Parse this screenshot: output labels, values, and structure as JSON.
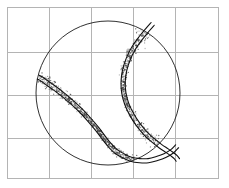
{
  "figure": {
    "title": "",
    "background_color": "#ffffff",
    "width": 229,
    "height": 188
  },
  "chart_data": {
    "type": "scatter",
    "title": "",
    "subtitle": "",
    "xlabel": "",
    "ylabel": "",
    "xlim": [
      -1.35,
      1.35
    ],
    "ylim": [
      -1.1,
      1.1
    ],
    "grid": true,
    "grid_color": "#b4b4b4",
    "axis_ticks_visible": false,
    "tick_labels_x": [],
    "tick_labels_y": [],
    "legend": null,
    "legend_position": "none",
    "annotations": [],
    "frame": {
      "x0": 7,
      "y0": 7,
      "x1": 218,
      "y1": 178,
      "color": "#b4b4b4",
      "line_width": 1
    },
    "gridlines": {
      "vertical_x": [
        49,
        91,
        133,
        175
      ],
      "horizontal_y": [
        52,
        95,
        138
      ],
      "columns": 5,
      "rows": 4
    },
    "series": [
      {
        "name": "sphere-outline",
        "kind": "circle",
        "color": "#1a1a1a",
        "line_width": 0.9,
        "center_px": [
          108,
          93
        ],
        "radius_px": 72,
        "center_data": [
          0.0,
          0.0
        ],
        "radius_data": 1.0
      },
      {
        "name": "seam-curve-outer",
        "kind": "line",
        "color": "#111111",
        "line_width": 1.1,
        "description": "tennis-ball seam, outer strand of the S-shaped double line"
      },
      {
        "name": "seam-curve-inner",
        "kind": "line",
        "color": "#111111",
        "line_width": 1.1,
        "description": "tennis-ball seam, inner strand of the S-shaped double line"
      },
      {
        "name": "sampled-points",
        "kind": "scatter",
        "color": "#3c3c3c",
        "marker": "dot",
        "marker_size": 0.65,
        "point_count": 1400,
        "description": "noisy sampled points clustered along the seam curve, denser at the lower-right loop and the upper-left cusp"
      }
    ],
    "seam_path_points": [
      [
        0.62,
        0.96
      ],
      [
        0.55,
        0.88
      ],
      [
        0.46,
        0.77
      ],
      [
        0.36,
        0.63
      ],
      [
        0.28,
        0.47
      ],
      [
        0.23,
        0.31
      ],
      [
        0.21,
        0.15
      ],
      [
        0.22,
        0.0
      ],
      [
        0.26,
        -0.15
      ],
      [
        0.33,
        -0.3
      ],
      [
        0.42,
        -0.44
      ],
      [
        0.52,
        -0.56
      ],
      [
        0.63,
        -0.66
      ],
      [
        0.73,
        -0.74
      ],
      [
        0.82,
        -0.8
      ],
      [
        0.89,
        -0.85
      ],
      [
        0.94,
        -0.89
      ],
      [
        0.97,
        -0.93
      ]
    ],
    "seam_path_points_left": [
      [
        -0.97,
        0.22
      ],
      [
        -0.93,
        0.2
      ],
      [
        -0.86,
        0.15
      ],
      [
        -0.76,
        0.08
      ],
      [
        -0.64,
        -0.01
      ],
      [
        -0.51,
        -0.12
      ],
      [
        -0.38,
        -0.24
      ],
      [
        -0.26,
        -0.37
      ],
      [
        -0.15,
        -0.5
      ],
      [
        -0.06,
        -0.62
      ],
      [
        0.02,
        -0.72
      ],
      [
        0.11,
        -0.81
      ],
      [
        0.21,
        -0.87
      ],
      [
        0.32,
        -0.92
      ],
      [
        0.44,
        -0.94
      ],
      [
        0.56,
        -0.94
      ],
      [
        0.68,
        -0.91
      ],
      [
        0.79,
        -0.87
      ],
      [
        0.89,
        -0.81
      ],
      [
        0.96,
        -0.74
      ]
    ]
  }
}
